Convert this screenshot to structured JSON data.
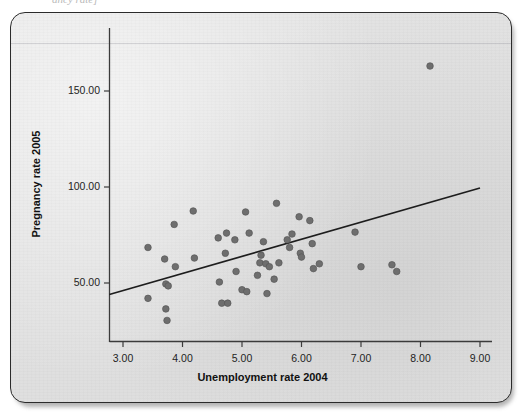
{
  "figure": {
    "top_clipped_text": "ancy rate]",
    "background_color": "#e3e3e3",
    "frame_color": "#2b2b2b",
    "point_color": "#6e6e6e",
    "line_color": "#1d1d1d"
  },
  "chart_data": {
    "type": "scatter",
    "title": "",
    "xlabel": "Unemployment rate 2004",
    "ylabel": "Pregnancy rate 2005",
    "xlim": [
      2.6,
      9.35
    ],
    "ylim": [
      18,
      178
    ],
    "xticks": [
      3.0,
      4.0,
      5.0,
      6.0,
      7.0,
      8.0,
      9.0
    ],
    "xticklabels": [
      "3.00",
      "4.00",
      "5.00",
      "6.00",
      "7.00",
      "8.00",
      "9.00"
    ],
    "yticks": [
      50.0,
      100.0,
      150.0
    ],
    "yticklabels": [
      "50.00",
      "100.00",
      "150.00"
    ],
    "grid": false,
    "legend": null,
    "fit_line": {
      "type": "linear",
      "x_start": 2.77,
      "y_start": 44.0,
      "x_end": 9.0,
      "y_end": 99.5
    },
    "points": [
      [
        3.42,
        68.5
      ],
      [
        3.42,
        42.0
      ],
      [
        3.7,
        62.5
      ],
      [
        3.72,
        49.5
      ],
      [
        3.76,
        48.5
      ],
      [
        3.72,
        36.5
      ],
      [
        3.74,
        30.5
      ],
      [
        3.86,
        80.5
      ],
      [
        3.88,
        58.5
      ],
      [
        4.18,
        87.5
      ],
      [
        4.2,
        63.0
      ],
      [
        4.6,
        73.5
      ],
      [
        4.62,
        50.5
      ],
      [
        4.66,
        39.5
      ],
      [
        4.74,
        76.0
      ],
      [
        4.76,
        39.5
      ],
      [
        4.72,
        65.5
      ],
      [
        4.88,
        72.5
      ],
      [
        4.9,
        56.0
      ],
      [
        5.0,
        46.5
      ],
      [
        5.06,
        87.0
      ],
      [
        5.08,
        45.5
      ],
      [
        5.12,
        76.0
      ],
      [
        5.26,
        54.0
      ],
      [
        5.3,
        60.5
      ],
      [
        5.32,
        64.5
      ],
      [
        5.36,
        71.5
      ],
      [
        5.4,
        60.0
      ],
      [
        5.42,
        44.5
      ],
      [
        5.46,
        58.5
      ],
      [
        5.54,
        52.0
      ],
      [
        5.58,
        91.5
      ],
      [
        5.62,
        60.5
      ],
      [
        5.76,
        72.5
      ],
      [
        5.8,
        68.5
      ],
      [
        5.84,
        75.5
      ],
      [
        5.96,
        84.5
      ],
      [
        5.98,
        65.5
      ],
      [
        6.0,
        63.5
      ],
      [
        6.14,
        82.5
      ],
      [
        6.18,
        70.5
      ],
      [
        6.2,
        57.5
      ],
      [
        6.3,
        60.0
      ],
      [
        6.9,
        76.5
      ],
      [
        7.0,
        58.5
      ],
      [
        7.52,
        59.5
      ],
      [
        7.6,
        56.0
      ],
      [
        8.16,
        163.0
      ]
    ]
  }
}
